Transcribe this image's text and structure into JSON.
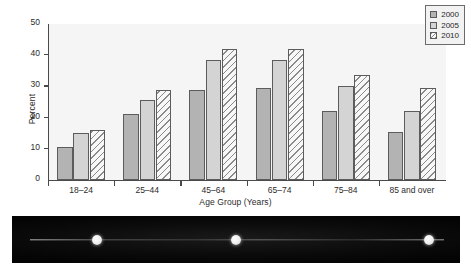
{
  "chart_data": {
    "type": "bar",
    "title": "",
    "subtitle": "",
    "xlabel": "Age Group (Years)",
    "ylabel": "Percent",
    "categories": [
      "18–24",
      "25–44",
      "45–64",
      "65–74",
      "75–84",
      "85 and over"
    ],
    "series": [
      {
        "name": "2000",
        "values": [
          10.5,
          21.0,
          29.0,
          29.5,
          22.0,
          15.5
        ],
        "color": "#b3b3b3",
        "pattern": "solid-dark-grey"
      },
      {
        "name": "2005",
        "values": [
          15.0,
          25.5,
          38.5,
          38.5,
          30.0,
          22.0
        ],
        "color": "#d4d4d4",
        "pattern": "solid-light-grey"
      },
      {
        "name": "2010",
        "values": [
          16.0,
          29.0,
          42.0,
          42.0,
          33.5,
          29.5
        ],
        "color": "#f7f7f7",
        "pattern": "diagonal-hatch"
      }
    ],
    "ylim": [
      0,
      50
    ],
    "yticks": [
      0,
      10,
      20,
      30,
      40,
      50
    ],
    "ytick_labels": [
      "0",
      "10",
      "20",
      "30",
      "40",
      "50"
    ],
    "grid": false,
    "legend_position": "top-right",
    "legend_entries": [
      "2000",
      "2005",
      "2010"
    ],
    "plot_background": "#f5f5f5",
    "axis_color": "#4a4a4a"
  },
  "scan_strip": {
    "dots": [
      "scan-dot-left",
      "scan-dot-center",
      "scan-dot-right"
    ],
    "dot_positions_pct": [
      19,
      50,
      93
    ],
    "background_color": "#050505",
    "line_color": "#d2d2d2"
  }
}
